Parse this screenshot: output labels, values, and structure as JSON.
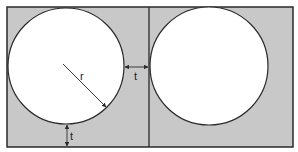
{
  "diagram": {
    "colors": {
      "background_fill": "#c8c8c8",
      "circle_fill": "#ffffff",
      "stroke": "#2a2a2a",
      "page": "#ffffff"
    },
    "outer_rect": {
      "x": 7,
      "y": 7,
      "width": 286,
      "height": 140
    },
    "divider": {
      "x": 149
    },
    "circles": [
      {
        "name": "left",
        "cx": 66,
        "cy": 66,
        "r": 58
      },
      {
        "name": "right",
        "cx": 209,
        "cy": 66,
        "r": 59
      }
    ],
    "labels": {
      "radius": "r",
      "thickness_side": "t",
      "thickness_bottom": "t"
    },
    "radius_line": {
      "x1": 63,
      "y1": 64,
      "x2": 107,
      "y2": 108
    },
    "side_dimension": {
      "x1": 124,
      "x2": 149,
      "y": 67
    },
    "bottom_dimension": {
      "x": 67,
      "y1": 124,
      "y2": 147
    }
  }
}
